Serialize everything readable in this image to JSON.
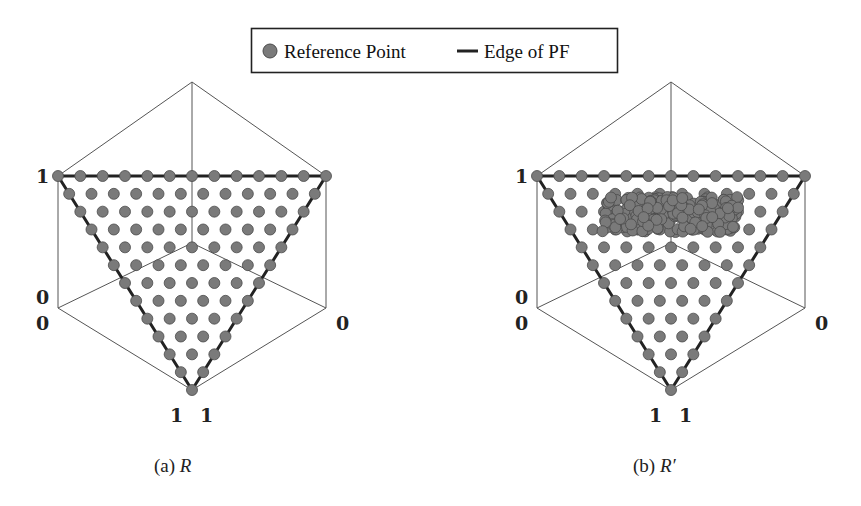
{
  "legend": {
    "items": [
      {
        "label": "Reference Point",
        "marker": "circle",
        "color": "#777777"
      },
      {
        "label": "Edge of PF",
        "marker": "line",
        "color": "#222222"
      }
    ]
  },
  "panels": [
    {
      "caption_prefix": "(a)",
      "caption_var": "R",
      "tick_labels": {
        "top_left": "1",
        "mid_left_upper": "0",
        "mid_left_lower": "0",
        "mid_right": "0",
        "bottom_left": "1",
        "bottom_right": "1"
      },
      "cluster": false
    },
    {
      "caption_prefix": "(b)",
      "caption_var": "R′",
      "tick_labels": {
        "top_left": "1",
        "mid_left_upper": "0",
        "mid_left_lower": "0",
        "mid_right": "0",
        "bottom_left": "1",
        "bottom_right": "1"
      },
      "cluster": true
    }
  ],
  "chart_data": [
    {
      "type": "scatter",
      "title": "(a) R",
      "description": "Uniform reference points on 3-objective simplex (inverted triangle), 12 divisions, 91 points",
      "divisions": 12,
      "num_points": 91,
      "axes_range": [
        0,
        1
      ],
      "legend": [
        "Reference Point",
        "Edge of PF"
      ]
    },
    {
      "type": "scatter",
      "title": "(b) R′",
      "description": "Same uniform reference points plus a dense cluster of points in upper-center region of simplex",
      "divisions": 12,
      "num_points_uniform": 91,
      "cluster_region": {
        "x_pixel_range": [
          598,
          745
        ],
        "y_pixel_range": [
          193,
          235
        ]
      },
      "axes_range": [
        0,
        1
      ],
      "legend": [
        "Reference Point",
        "Edge of PF"
      ]
    }
  ],
  "colors": {
    "point_fill": "#7a7a7a",
    "point_stroke": "#4a4a4a",
    "edge": "#222222",
    "axis": "#555555"
  }
}
